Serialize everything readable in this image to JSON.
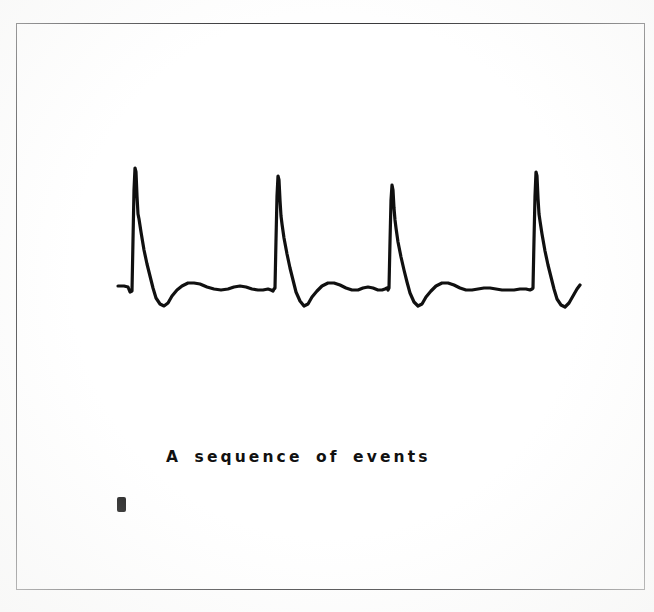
{
  "figure": {
    "caption": "A sequence of events",
    "mark_label": "block-mark",
    "frame": {
      "x": 16,
      "y": 23,
      "width": 629,
      "height": 567,
      "border_color": "#3a3a3c",
      "background_color": "#ffffff"
    },
    "page_background_color": "#fefefe",
    "trace_color": "#101010"
  },
  "chart_data": {
    "type": "line",
    "title": "A sequence of events",
    "subtitle": "",
    "xlabel": "",
    "ylabel": "",
    "grid": false,
    "legend": "none",
    "axes_visible": false,
    "tick_labels_x": [],
    "tick_labels_y": [],
    "xlim": [
      118,
      580
    ],
    "ylim": [
      168,
      310
    ],
    "baseline_y": 289,
    "series": [
      {
        "name": "ECG trace",
        "color": "#101010",
        "line_width": 3.2,
        "points": [
          [
            118,
            286
          ],
          [
            124,
            286
          ],
          [
            128,
            287
          ],
          [
            130,
            292
          ],
          [
            132,
            291
          ],
          [
            133,
            240
          ],
          [
            134,
            190
          ],
          [
            135,
            168
          ],
          [
            136,
            172
          ],
          [
            137,
            196
          ],
          [
            138,
            214
          ],
          [
            139,
            219
          ],
          [
            141,
            232
          ],
          [
            144,
            250
          ],
          [
            147,
            264
          ],
          [
            150,
            276
          ],
          [
            153,
            288
          ],
          [
            156,
            298
          ],
          [
            160,
            304
          ],
          [
            164,
            306
          ],
          [
            168,
            303
          ],
          [
            172,
            296
          ],
          [
            177,
            290
          ],
          [
            182,
            286
          ],
          [
            188,
            283
          ],
          [
            194,
            283
          ],
          [
            200,
            284
          ],
          [
            207,
            287
          ],
          [
            214,
            289
          ],
          [
            221,
            290
          ],
          [
            228,
            289
          ],
          [
            234,
            287
          ],
          [
            240,
            286
          ],
          [
            246,
            287
          ],
          [
            252,
            289
          ],
          [
            258,
            290
          ],
          [
            263,
            290
          ],
          [
            268,
            289
          ],
          [
            271,
            290
          ],
          [
            273,
            291
          ],
          [
            274,
            289
          ],
          [
            275,
            288
          ],
          [
            276,
            240
          ],
          [
            277,
            196
          ],
          [
            278,
            176
          ],
          [
            279,
            180
          ],
          [
            280,
            200
          ],
          [
            281,
            216
          ],
          [
            282,
            224
          ],
          [
            284,
            238
          ],
          [
            287,
            254
          ],
          [
            290,
            268
          ],
          [
            293,
            280
          ],
          [
            296,
            292
          ],
          [
            300,
            301
          ],
          [
            304,
            306
          ],
          [
            308,
            304
          ],
          [
            312,
            297
          ],
          [
            317,
            291
          ],
          [
            322,
            286
          ],
          [
            328,
            283
          ],
          [
            334,
            283
          ],
          [
            340,
            285
          ],
          [
            346,
            288
          ],
          [
            352,
            290
          ],
          [
            358,
            290
          ],
          [
            363,
            288
          ],
          [
            368,
            287
          ],
          [
            373,
            288
          ],
          [
            378,
            290
          ],
          [
            382,
            290
          ],
          [
            385,
            289
          ],
          [
            387,
            288
          ],
          [
            388,
            290
          ],
          [
            389,
            288
          ],
          [
            390,
            242
          ],
          [
            391,
            200
          ],
          [
            392,
            185
          ],
          [
            393,
            190
          ],
          [
            394,
            208
          ],
          [
            395,
            220
          ],
          [
            396,
            228
          ],
          [
            398,
            242
          ],
          [
            401,
            257
          ],
          [
            404,
            270
          ],
          [
            407,
            282
          ],
          [
            410,
            293
          ],
          [
            414,
            302
          ],
          [
            418,
            306
          ],
          [
            422,
            304
          ],
          [
            426,
            297
          ],
          [
            431,
            291
          ],
          [
            436,
            286
          ],
          [
            442,
            283
          ],
          [
            448,
            283
          ],
          [
            454,
            285
          ],
          [
            460,
            288
          ],
          [
            466,
            290
          ],
          [
            472,
            290
          ],
          [
            478,
            289
          ],
          [
            484,
            288
          ],
          [
            490,
            288
          ],
          [
            496,
            289
          ],
          [
            502,
            290
          ],
          [
            508,
            290
          ],
          [
            514,
            290
          ],
          [
            520,
            289
          ],
          [
            526,
            289
          ],
          [
            530,
            290
          ],
          [
            532,
            289
          ],
          [
            533,
            288
          ],
          [
            534,
            240
          ],
          [
            535,
            196
          ],
          [
            536,
            172
          ],
          [
            537,
            176
          ],
          [
            538,
            198
          ],
          [
            539,
            214
          ],
          [
            540,
            221
          ],
          [
            542,
            234
          ],
          [
            545,
            251
          ],
          [
            548,
            265
          ],
          [
            551,
            277
          ],
          [
            554,
            289
          ],
          [
            557,
            299
          ],
          [
            561,
            305
          ],
          [
            565,
            307
          ],
          [
            569,
            303
          ],
          [
            573,
            296
          ],
          [
            577,
            289
          ],
          [
            580,
            285
          ]
        ]
      }
    ],
    "events": [
      {
        "name": "beat-1",
        "r_peak_x": 135,
        "r_peak_y": 168
      },
      {
        "name": "beat-2",
        "r_peak_x": 278,
        "r_peak_y": 176
      },
      {
        "name": "beat-3",
        "r_peak_x": 392,
        "r_peak_y": 185
      },
      {
        "name": "beat-4",
        "r_peak_x": 536,
        "r_peak_y": 172
      }
    ]
  }
}
